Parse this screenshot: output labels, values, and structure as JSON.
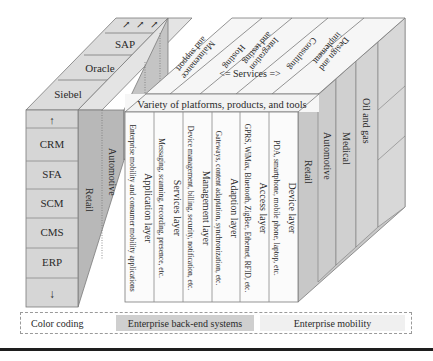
{
  "backend_block": {
    "top_items": [
      "SAP",
      "Oracle",
      "Siebel"
    ],
    "front_items": [
      "CRM",
      "SFA",
      "SCM",
      "CMS",
      "ERP"
    ],
    "arrow_up": "↑",
    "arrow_down": "↓",
    "side_verticals": [
      "Retail",
      "Automotive"
    ]
  },
  "services": {
    "label": "<=   Services   =>",
    "items": [
      "Maintenance and support",
      "Hosting",
      "Integration and testing",
      "Consulting",
      "Design and implement"
    ]
  },
  "platforms_label": "Variety of platforms, products, and tools",
  "layers": [
    {
      "title": "Application layer",
      "desc": "Enterprise mobility and consumer mobility applications"
    },
    {
      "title": "Services layer",
      "desc": "Messaging, scanning, recording, presence, etc."
    },
    {
      "title": "Management layer",
      "desc": "Device management, billing, security, notification, etc."
    },
    {
      "title": "Adaption layer",
      "desc": "Gateways, content adaptation, synchronization, etc."
    },
    {
      "title": "Access layer",
      "desc": "GPRS, WiMax, Bluetooth, ZigBee, Ethernet, RFID, etc."
    },
    {
      "title": "Device layer",
      "desc": "PDA, smartphone, mobile phone, laptop, etc."
    }
  ],
  "verticals": [
    "Retail",
    "Automotive",
    "Medical",
    "Oil and gas"
  ],
  "legend": {
    "label": "Color coding",
    "backend": "Enterprise back-end systems",
    "mobility": "Enterprise mobility"
  },
  "colors": {
    "backend": "#cfcfcf",
    "backend_dark": "#b5b5b5",
    "mobility": "#f2f2f2",
    "line": "#7a7a7a"
  }
}
